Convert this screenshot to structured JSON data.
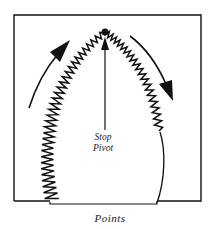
{
  "diagram": {
    "title": "Points",
    "labels": {
      "stop": "Stop",
      "pivot": "Pivot"
    },
    "elements": [
      "frame",
      "zigzag-stitch-path",
      "pivot-point",
      "pivot-arrow",
      "left-direction-arrow",
      "right-direction-arrow",
      "plain-edge-curve"
    ],
    "colors": {
      "ink": "#111111",
      "background": "#ffffff"
    }
  }
}
